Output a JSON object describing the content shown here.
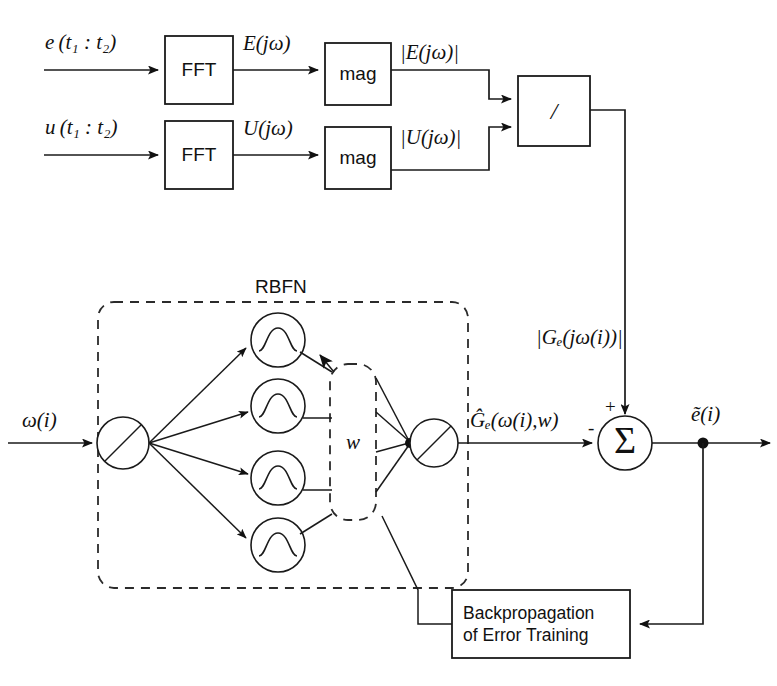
{
  "diagram": {
    "rbfn_group_label": "RBFN",
    "blocks": {
      "fft_top": "FFT",
      "fft_bottom": "FFT",
      "mag_top": "mag",
      "mag_bottom": "mag",
      "divider": "/",
      "backprop_line1": "Backpropagation",
      "backprop_line2": "of Error Training",
      "sum": "Σ",
      "weights": "w"
    },
    "signals": {
      "input_e": "e (t₁ : t₂)",
      "input_u": "u (t₁ : t₂)",
      "fft_out_e": "E(jω)",
      "fft_out_u": "U(jω)",
      "mag_out_e": "|E(jω)|",
      "mag_out_u": "|U(jω)|",
      "divider_out": "|Gₑ(jω(i))|",
      "rbfn_input": "ω(i)",
      "rbfn_output": "Ĝₑ(ω(i),w)",
      "error_out": "ẽ(i)"
    },
    "signs": {
      "sum_plus": "+",
      "sum_minus": "-"
    },
    "colors": {
      "ink": "#1a1a1a",
      "paper": "#ffffff",
      "dashed": "#2b2b2b"
    },
    "counts": {
      "hidden_nodes": 4
    }
  }
}
